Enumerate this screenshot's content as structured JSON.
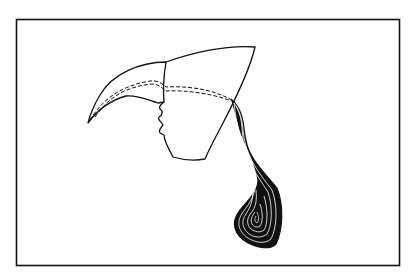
{
  "figure": {
    "stroke_color": "#111111",
    "background_color": "#ffffff"
  }
}
